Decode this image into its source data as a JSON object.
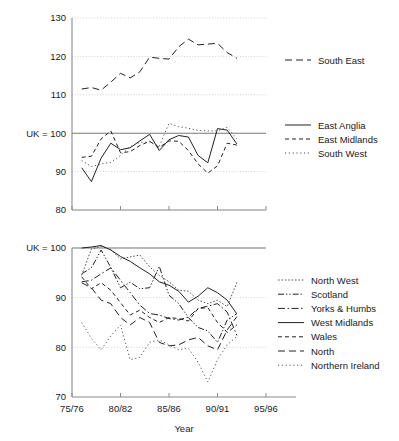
{
  "chart_data": [
    {
      "type": "line",
      "title": "",
      "panel": "upper",
      "xlabel": "",
      "ylabel": "",
      "x_tick_labels": [
        "75/76",
        "80/82",
        "85/86",
        "90/91",
        "95/96"
      ],
      "x_tick_values": [
        1975,
        1980,
        1985,
        1990,
        1995
      ],
      "xlim": [
        1975,
        1995
      ],
      "ylim": [
        80,
        130
      ],
      "y_tick_labels": [
        "80",
        "90",
        "UK = 100",
        "110",
        "120",
        "130"
      ],
      "y_tick_values": [
        80,
        90,
        100,
        110,
        120,
        130
      ],
      "grid": true,
      "reference_line": 100,
      "reference_label": "UK = 100",
      "legend_position": "right",
      "series": [
        {
          "name": "South East",
          "style": "dashed",
          "x": [
            1976,
            1977,
            1978,
            1979,
            1980,
            1981,
            1982,
            1983,
            1984,
            1985,
            1986,
            1987,
            1988,
            1989,
            1990,
            1991,
            1992
          ],
          "values": [
            111.5,
            111.9,
            111.2,
            113.3,
            115.6,
            114.4,
            116.0,
            119.8,
            119.5,
            119.3,
            122.5,
            124.5,
            123.0,
            123.2,
            123.4,
            121.0,
            119.5
          ]
        },
        {
          "name": "East Anglia",
          "style": "solid",
          "x": [
            1976,
            1977,
            1978,
            1979,
            1980,
            1981,
            1982,
            1983,
            1984,
            1985,
            1986,
            1987,
            1988,
            1989,
            1990,
            1991,
            1992
          ],
          "values": [
            91.0,
            87.4,
            93.5,
            97.4,
            95.7,
            96.2,
            98.0,
            99.7,
            95.5,
            98.3,
            99.4,
            99.0,
            94.2,
            92.3,
            101.2,
            100.8,
            97.2,
            99.8
          ]
        },
        {
          "name": "East Midlands",
          "style": "dashed-short",
          "x": [
            1976,
            1977,
            1978,
            1979,
            1980,
            1981,
            1982,
            1983,
            1984,
            1985,
            1986,
            1987,
            1988,
            1989,
            1990,
            1991,
            1992
          ],
          "values": [
            93.7,
            94.0,
            98.5,
            100.6,
            94.9,
            95.2,
            96.8,
            97.9,
            96.3,
            98.0,
            97.9,
            95.5,
            92.0,
            89.6,
            91.5,
            97.4,
            96.9,
            98.6
          ]
        },
        {
          "name": "South West",
          "style": "dotted",
          "x": [
            1976,
            1977,
            1978,
            1979,
            1980,
            1981,
            1982,
            1983,
            1984,
            1985,
            1986,
            1987,
            1988,
            1989,
            1990,
            1991,
            1992
          ],
          "values": [
            92.9,
            91.3,
            92.0,
            92.4,
            94.2,
            96.5,
            97.6,
            97.7,
            96.6,
            102.6,
            101.7,
            101.3,
            100.7,
            100.6,
            100.6,
            101.5,
            98.5
          ]
        }
      ]
    },
    {
      "type": "line",
      "title": "",
      "panel": "lower",
      "xlabel": "Year",
      "ylabel": "",
      "x_tick_labels": [
        "75/76",
        "80/82",
        "85/86",
        "90/91",
        "95/96"
      ],
      "x_tick_values": [
        1975,
        1980,
        1985,
        1990,
        1995
      ],
      "xlim": [
        1975,
        1995
      ],
      "ylim": [
        70,
        100
      ],
      "y_tick_labels": [
        "70",
        "80",
        "90",
        "UK = 100"
      ],
      "y_tick_values": [
        70,
        80,
        90,
        100
      ],
      "grid": true,
      "reference_line": 100,
      "reference_label": "UK = 100",
      "legend_position": "right",
      "series": [
        {
          "name": "North West",
          "style": "dotted-dense",
          "x": [
            1976,
            1977,
            1978,
            1979,
            1980,
            1981,
            1982,
            1983,
            1984,
            1985,
            1986,
            1987,
            1988,
            1989,
            1990,
            1991,
            1992
          ],
          "values": [
            94.5,
            99.8,
            100.3,
            99.7,
            97.8,
            98.2,
            98.6,
            96.2,
            94.5,
            93.2,
            91.5,
            91.3,
            89.5,
            88.8,
            89.5,
            88.2,
            93.1
          ]
        },
        {
          "name": "Scotland",
          "style": "dash-dot-dot",
          "x": [
            1976,
            1977,
            1978,
            1979,
            1980,
            1981,
            1982,
            1983,
            1984,
            1985,
            1986,
            1987,
            1988,
            1989,
            1990,
            1991,
            1992
          ],
          "values": [
            94.8,
            96.0,
            99.6,
            96.1,
            92.0,
            93.1,
            91.8,
            92.0,
            96.3,
            90.5,
            88.8,
            86.0,
            84.0,
            83.3,
            81.0,
            85.5,
            86.8
          ]
        },
        {
          "name": "Yorks & Humbs",
          "style": "dash-dot",
          "x": [
            1976,
            1977,
            1978,
            1979,
            1980,
            1981,
            1982,
            1983,
            1984,
            1985,
            1986,
            1987,
            1988,
            1989,
            1990,
            1991,
            1992
          ],
          "values": [
            93.2,
            93.5,
            94.8,
            96.0,
            93.5,
            91.0,
            88.5,
            86.8,
            86.5,
            85.8,
            85.5,
            86.1,
            87.8,
            88.3,
            88.8,
            87.1,
            82.4
          ]
        },
        {
          "name": "West Midlands",
          "style": "solid",
          "x": [
            1976,
            1977,
            1978,
            1979,
            1980,
            1981,
            1982,
            1983,
            1984,
            1985,
            1986,
            1987,
            1988,
            1989,
            1990,
            1991,
            1992
          ],
          "values": [
            100.0,
            100.2,
            100.5,
            99.6,
            98.3,
            97.3,
            96.0,
            94.8,
            93.2,
            92.5,
            91.3,
            89.1,
            90.3,
            92.0,
            91.0,
            89.5,
            86.7
          ]
        },
        {
          "name": "Wales",
          "style": "dashed-short",
          "x": [
            1976,
            1977,
            1978,
            1979,
            1980,
            1981,
            1982,
            1983,
            1984,
            1985,
            1986,
            1987,
            1988,
            1989,
            1990,
            1991,
            1992
          ],
          "values": [
            94.2,
            91.8,
            93.0,
            91.5,
            89.0,
            86.5,
            87.5,
            86.0,
            85.0,
            86.0,
            85.8,
            85.3,
            87.8,
            88.0,
            85.0,
            83.0,
            84.5
          ]
        },
        {
          "name": "North",
          "style": "dashed",
          "x": [
            1976,
            1977,
            1978,
            1979,
            1980,
            1981,
            1982,
            1983,
            1984,
            1985,
            1986,
            1987,
            1988,
            1989,
            1990,
            1991,
            1992
          ],
          "values": [
            93.0,
            92.0,
            89.5,
            88.8,
            86.0,
            84.5,
            86.0,
            85.0,
            81.0,
            80.3,
            80.5,
            81.5,
            82.0,
            80.3,
            79.5,
            83.5,
            86.2
          ]
        },
        {
          "name": "Northern Ireland",
          "style": "dotted",
          "x": [
            1976,
            1977,
            1978,
            1979,
            1980,
            1981,
            1982,
            1983,
            1984,
            1985,
            1986,
            1987,
            1988,
            1989,
            1990,
            1991,
            1992
          ],
          "values": [
            85.0,
            81.8,
            79.5,
            82.3,
            84.5,
            77.5,
            78.0,
            81.0,
            81.5,
            80.5,
            79.5,
            79.8,
            77.0,
            73.0,
            77.5,
            80.5,
            82.2
          ]
        }
      ]
    }
  ],
  "upper_panel": {
    "y_axis": {
      "labels": [
        "130",
        "120",
        "110",
        "UK = 100",
        "90",
        "80"
      ]
    },
    "legend": {
      "groups": [
        {
          "entries": [
            {
              "label": "South East",
              "style": "dashed"
            }
          ]
        },
        {
          "entries": [
            {
              "label": "East Anglia",
              "style": "solid"
            },
            {
              "label": "East Midlands",
              "style": "dashed-short"
            },
            {
              "label": "South West",
              "style": "dotted"
            }
          ]
        }
      ]
    }
  },
  "lower_panel": {
    "y_axis": {
      "labels": [
        "UK = 100",
        "90",
        "80",
        "70"
      ]
    },
    "x_axis": {
      "labels": [
        "75/76",
        "80/82",
        "85/86",
        "90/91",
        "95/96"
      ],
      "title": "Year"
    },
    "legend": {
      "entries": [
        {
          "label": "North West",
          "style": "dotted-dense"
        },
        {
          "label": "Scotland",
          "style": "dash-dot-dot"
        },
        {
          "label": "Yorks & Humbs",
          "style": "dash-dot"
        },
        {
          "label": "West Midlands",
          "style": "solid"
        },
        {
          "label": "Wales",
          "style": "dashed-short"
        },
        {
          "label": "North",
          "style": "dashed"
        },
        {
          "label": "Northern Ireland",
          "style": "dotted"
        }
      ]
    }
  },
  "colors": {
    "ink": "#1a1a1a",
    "series": "#222222",
    "axis": "#8a8a8a",
    "grid": "#bdbdbd",
    "reference": "#777777",
    "background": "#ffffff"
  }
}
